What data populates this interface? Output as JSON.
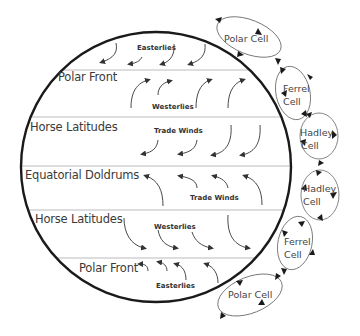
{
  "diagram": {
    "zones": [
      {
        "label": "Polar Front",
        "x": 58,
        "y": 78
      },
      {
        "label": "Horse Latitudes",
        "x": 30,
        "y": 124
      },
      {
        "label": "Equatorial Doldrums",
        "x": 25,
        "y": 174
      },
      {
        "label": "Horse Latitudes",
        "x": 35,
        "y": 218
      },
      {
        "label": "Polar Front",
        "x": 79,
        "y": 265
      }
    ],
    "winds": [
      {
        "label": "Easterlies",
        "x": 137,
        "y": 45
      },
      {
        "label": "Westerlies",
        "x": 152,
        "y": 104
      },
      {
        "label": "Trade Winds",
        "x": 154,
        "y": 127
      },
      {
        "label": "Trade Winds",
        "x": 190,
        "y": 197
      },
      {
        "label": "Westerlies",
        "x": 154,
        "y": 224
      },
      {
        "label": "Easterlies",
        "x": 156,
        "y": 283
      }
    ],
    "cells": [
      {
        "line1": "Polar Cell",
        "line2": "",
        "x": 223,
        "y": 13
      },
      {
        "line1": "Ferrel",
        "line2": "Cell",
        "x": 283,
        "y": 83
      },
      {
        "line1": "Hadley",
        "line2": "Cell",
        "x": 300,
        "y": 127
      },
      {
        "line1": "Hadley",
        "line2": "Cell",
        "x": 302,
        "y": 185
      },
      {
        "line1": "Ferrel",
        "line2": "Cell",
        "x": 284,
        "y": 238
      },
      {
        "line1": "Polar Cell",
        "line2": "",
        "x": 228,
        "y": 293
      }
    ],
    "colors": {
      "globe_outline": "#1a1a1a",
      "band_lines": "#bbbbbb",
      "arrows": "#333333",
      "cells": "#555555"
    }
  }
}
